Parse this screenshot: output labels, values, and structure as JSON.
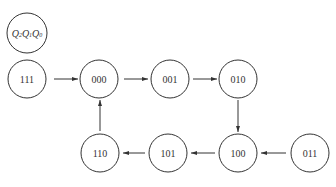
{
  "diagram": {
    "type": "state-transition",
    "legend": {
      "label": "Q2Q1Q0",
      "parts": [
        "Q",
        "2",
        "Q",
        "1",
        "Q",
        "0"
      ],
      "cx": 27,
      "cy": 33
    },
    "states": [
      {
        "id": "s111",
        "label": "111",
        "cx": 27,
        "cy": 79
      },
      {
        "id": "s000",
        "label": "000",
        "cx": 99,
        "cy": 79
      },
      {
        "id": "s001",
        "label": "001",
        "cx": 170,
        "cy": 79
      },
      {
        "id": "s010",
        "label": "010",
        "cx": 238,
        "cy": 79
      },
      {
        "id": "s100",
        "label": "100",
        "cx": 238,
        "cy": 153
      },
      {
        "id": "s101",
        "label": "101",
        "cx": 168,
        "cy": 153
      },
      {
        "id": "s110",
        "label": "110",
        "cx": 100,
        "cy": 153
      },
      {
        "id": "s011",
        "label": "011",
        "cx": 310,
        "cy": 153
      }
    ],
    "transitions": [
      {
        "from": "111",
        "to": "000"
      },
      {
        "from": "000",
        "to": "001"
      },
      {
        "from": "001",
        "to": "010"
      },
      {
        "from": "010",
        "to": "100"
      },
      {
        "from": "011",
        "to": "100"
      },
      {
        "from": "100",
        "to": "101"
      },
      {
        "from": "101",
        "to": "110"
      },
      {
        "from": "110",
        "to": "000"
      }
    ],
    "colors": {
      "stroke": "#333333",
      "background": "#ffffff"
    }
  }
}
